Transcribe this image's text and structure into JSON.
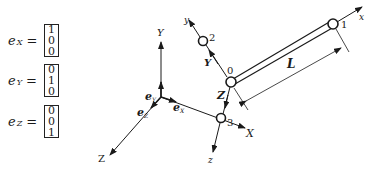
{
  "unit_vectors": [
    {
      "name": "e",
      "subscript": "X",
      "equals": "=",
      "components": [
        "1",
        "0",
        "0"
      ]
    },
    {
      "name": "e",
      "subscript": "Y",
      "equals": "=",
      "components": [
        "0",
        "1",
        "0"
      ]
    },
    {
      "name": "e",
      "subscript": "Z",
      "equals": "=",
      "components": [
        "0",
        "0",
        "1"
      ]
    }
  ],
  "global_axes": {
    "X": "X",
    "Y": "Y",
    "Z": "Z",
    "eX": "e",
    "eX_sub": "X",
    "eY": "e",
    "eY_sub": "Y",
    "eZ": "e",
    "eZ_sub": "Z"
  },
  "local_axes": {
    "x": "x",
    "y": "y",
    "z": "z",
    "Y_member": "Y",
    "Z_member": "Z"
  },
  "nodes": [
    {
      "id": "0"
    },
    {
      "id": "1"
    },
    {
      "id": "2"
    },
    {
      "id": "3"
    }
  ],
  "dimension": {
    "label": "L"
  },
  "colors": {
    "line": "#1a1a1a",
    "background": "#ffffff"
  }
}
